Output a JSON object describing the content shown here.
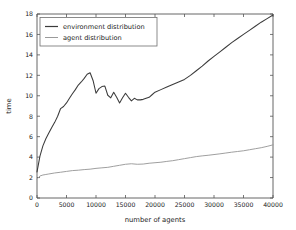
{
  "chart_data": {
    "type": "line",
    "title": "",
    "xlabel": "number of agents",
    "ylabel": "time",
    "xlim": [
      0,
      40000
    ],
    "ylim": [
      0,
      18
    ],
    "grid": false,
    "legend_position": "upper left",
    "xticks": [
      0,
      5000,
      10000,
      15000,
      20000,
      25000,
      30000,
      35000,
      40000
    ],
    "xtick_labels": [
      "0",
      "5000",
      "10000",
      "15000",
      "20000",
      "25000",
      "30000",
      "35000",
      "40000"
    ],
    "yticks": [
      0,
      2,
      4,
      6,
      8,
      10,
      12,
      14,
      16,
      18
    ],
    "ytick_labels": [
      "0",
      "2",
      "4",
      "6",
      "8",
      "10",
      "12",
      "14",
      "16",
      "18"
    ],
    "series": [
      {
        "name": "environment distribution",
        "color": "#3b3b3b",
        "x": [
          0,
          500,
          1000,
          1500,
          2000,
          2500,
          3000,
          3500,
          4000,
          4500,
          5000,
          5500,
          6000,
          6500,
          7000,
          7500,
          8000,
          8500,
          9000,
          9500,
          10000,
          10500,
          11000,
          11500,
          12000,
          12500,
          13000,
          13500,
          14000,
          14500,
          15000,
          15500,
          16000,
          16500,
          17000,
          17500,
          18000,
          18500,
          19000,
          19500,
          20000,
          21000,
          22000,
          23000,
          24000,
          25000,
          26000,
          27000,
          28000,
          29000,
          30000,
          31000,
          32000,
          33000,
          34000,
          35000,
          36000,
          37000,
          38000,
          39000,
          40000
        ],
        "y": [
          2.55,
          4.1,
          5.1,
          5.8,
          6.35,
          6.9,
          7.4,
          8.0,
          8.75,
          8.95,
          9.3,
          9.75,
          10.2,
          10.6,
          11.05,
          11.35,
          11.7,
          12.1,
          12.25,
          11.5,
          10.25,
          10.7,
          10.9,
          10.95,
          10.05,
          9.8,
          10.35,
          9.85,
          9.3,
          9.8,
          10.25,
          9.85,
          9.5,
          9.75,
          9.6,
          9.6,
          9.65,
          9.75,
          9.85,
          10.1,
          10.35,
          10.6,
          10.85,
          11.1,
          11.35,
          11.6,
          12.0,
          12.45,
          12.9,
          13.4,
          13.85,
          14.3,
          14.75,
          15.2,
          15.6,
          16.0,
          16.4,
          16.8,
          17.2,
          17.55,
          17.9
        ]
      },
      {
        "name": "agent distribution",
        "color": "#9a9a9a",
        "x": [
          0,
          500,
          1000,
          1500,
          2000,
          3000,
          4000,
          5000,
          6000,
          7000,
          8000,
          9000,
          10000,
          11000,
          12000,
          13000,
          14000,
          15000,
          16000,
          17000,
          18000,
          19000,
          20000,
          21000,
          22000,
          23000,
          24000,
          25000,
          26000,
          27000,
          28000,
          29000,
          30000,
          31000,
          32000,
          33000,
          34000,
          35000,
          36000,
          37000,
          38000,
          39000,
          40000
        ],
        "y": [
          1.85,
          2.15,
          2.25,
          2.3,
          2.35,
          2.45,
          2.52,
          2.6,
          2.68,
          2.72,
          2.78,
          2.82,
          2.9,
          2.95,
          3.0,
          3.1,
          3.2,
          3.3,
          3.35,
          3.3,
          3.32,
          3.4,
          3.45,
          3.5,
          3.58,
          3.65,
          3.75,
          3.85,
          3.95,
          4.05,
          4.12,
          4.18,
          4.25,
          4.32,
          4.4,
          4.48,
          4.55,
          4.62,
          4.72,
          4.82,
          4.92,
          5.05,
          5.2
        ]
      }
    ]
  },
  "legend": {
    "entries": [
      {
        "label": "environment distribution"
      },
      {
        "label": "agent distribution"
      }
    ]
  }
}
